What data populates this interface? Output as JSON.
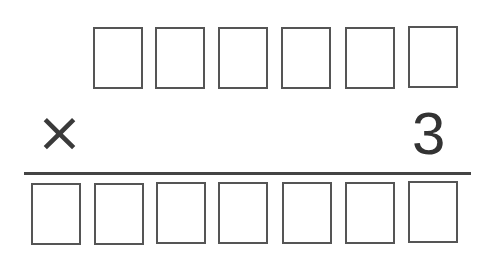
{
  "problem": {
    "operator": "×",
    "multiplier": "3",
    "multiplicand_boxes": [
      "",
      "",
      "",
      "",
      "",
      ""
    ],
    "product_boxes": [
      "",
      "",
      "",
      "",
      "",
      "",
      ""
    ]
  },
  "colors": {
    "box_border": "#555555",
    "rule": "#444444",
    "text": "#333333"
  }
}
